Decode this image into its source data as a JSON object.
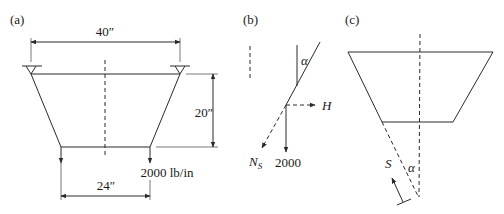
{
  "figure": {
    "panels": [
      {
        "id": "a",
        "label": "(a)",
        "dimensions": {
          "top_width": "40″",
          "height": "20″",
          "bottom_width": "24″"
        },
        "load_label": "2000 lb/in"
      },
      {
        "id": "b",
        "label": "(b)",
        "angle_label": "α",
        "horizontal_force_label": "H",
        "normal_force_label": "N",
        "normal_force_subscript": "S",
        "vertical_load_label": "2000"
      },
      {
        "id": "c",
        "label": "(c)",
        "angle_label": "α",
        "force_label": "S"
      }
    ],
    "colors": {
      "line": "#2a2a2a",
      "text": "#1a1a1a",
      "background": "#ffffff"
    }
  }
}
